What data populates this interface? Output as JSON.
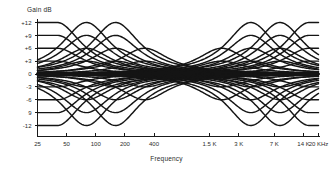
{
  "chart_data": {
    "type": "line",
    "title": "Gain dB",
    "xlabel": "Frequency",
    "ylabel": "Gain dB",
    "grid": false,
    "legend": "none",
    "ylim": [
      -12,
      12
    ],
    "y_ticks": [
      "+12",
      "+9",
      "+6",
      "+3",
      "0",
      "-3",
      "-6",
      "9",
      "-12"
    ],
    "y_tick_values": [
      12,
      9,
      6,
      3,
      0,
      -3,
      -6,
      -9,
      -12
    ],
    "x_ticks": [
      "25",
      "50",
      "100",
      "200",
      "400",
      "1.5 K",
      "3 K",
      "7 K",
      "14 K",
      "20 KHz"
    ],
    "x_tick_values": [
      25,
      50,
      100,
      200,
      400,
      1500,
      3000,
      7000,
      14000,
      20000
    ],
    "xlim": [
      25,
      20000
    ],
    "x_scale": "log",
    "band_centers": [
      40,
      80,
      160,
      320,
      2000,
      4000,
      8000,
      16000
    ],
    "settings_db": [
      12,
      9,
      6,
      3,
      -3,
      -6,
      -9,
      -12
    ],
    "series": [
      {
        "name": "Band 40 Hz +12 dB",
        "center": 40,
        "gain": 12,
        "shelf": "low"
      },
      {
        "name": "Band 40 Hz +9 dB",
        "center": 40,
        "gain": 9,
        "shelf": "low"
      },
      {
        "name": "Band 40 Hz +6 dB",
        "center": 40,
        "gain": 6,
        "shelf": "low"
      },
      {
        "name": "Band 40 Hz +3 dB",
        "center": 40,
        "gain": 3,
        "shelf": "low"
      },
      {
        "name": "Band 40 Hz -3 dB",
        "center": 40,
        "gain": -3,
        "shelf": "low"
      },
      {
        "name": "Band 40 Hz -6 dB",
        "center": 40,
        "gain": -6,
        "shelf": "low"
      },
      {
        "name": "Band 40 Hz -9 dB",
        "center": 40,
        "gain": -9,
        "shelf": "low"
      },
      {
        "name": "Band 40 Hz -12 dB",
        "center": 40,
        "gain": -12,
        "shelf": "low"
      },
      {
        "name": "Band 80 Hz +12 dB",
        "center": 80,
        "gain": 12,
        "shelf": "none"
      },
      {
        "name": "Band 80 Hz +9 dB",
        "center": 80,
        "gain": 9,
        "shelf": "none"
      },
      {
        "name": "Band 80 Hz +6 dB",
        "center": 80,
        "gain": 6,
        "shelf": "none"
      },
      {
        "name": "Band 80 Hz +3 dB",
        "center": 80,
        "gain": 3,
        "shelf": "none"
      },
      {
        "name": "Band 80 Hz -3 dB",
        "center": 80,
        "gain": -3,
        "shelf": "none"
      },
      {
        "name": "Band 80 Hz -6 dB",
        "center": 80,
        "gain": -6,
        "shelf": "none"
      },
      {
        "name": "Band 80 Hz -9 dB",
        "center": 80,
        "gain": -9,
        "shelf": "none"
      },
      {
        "name": "Band 80 Hz -12 dB",
        "center": 80,
        "gain": -12,
        "shelf": "none"
      },
      {
        "name": "Band 160 Hz +12 dB",
        "center": 160,
        "gain": 12,
        "shelf": "none"
      },
      {
        "name": "Band 160 Hz +9 dB",
        "center": 160,
        "gain": 9,
        "shelf": "none"
      },
      {
        "name": "Band 160 Hz +6 dB",
        "center": 160,
        "gain": 6,
        "shelf": "none"
      },
      {
        "name": "Band 160 Hz +3 dB",
        "center": 160,
        "gain": 3,
        "shelf": "none"
      },
      {
        "name": "Band 160 Hz -3 dB",
        "center": 160,
        "gain": -3,
        "shelf": "none"
      },
      {
        "name": "Band 160 Hz -6 dB",
        "center": 160,
        "gain": -6,
        "shelf": "none"
      },
      {
        "name": "Band 160 Hz -9 dB",
        "center": 160,
        "gain": -9,
        "shelf": "none"
      },
      {
        "name": "Band 160 Hz -12 dB",
        "center": 160,
        "gain": -12,
        "shelf": "none"
      },
      {
        "name": "Band 320 Hz +6 dB",
        "center": 320,
        "gain": 6,
        "shelf": "none"
      },
      {
        "name": "Band 320 Hz +3 dB",
        "center": 320,
        "gain": 3,
        "shelf": "none"
      },
      {
        "name": "Band 320 Hz -3 dB",
        "center": 320,
        "gain": -3,
        "shelf": "none"
      },
      {
        "name": "Band 320 Hz -6 dB",
        "center": 320,
        "gain": -6,
        "shelf": "none"
      },
      {
        "name": "Band 2 KHz +6 dB",
        "center": 2000,
        "gain": 6,
        "shelf": "none"
      },
      {
        "name": "Band 2 KHz +3 dB",
        "center": 2000,
        "gain": 3,
        "shelf": "none"
      },
      {
        "name": "Band 2 KHz -3 dB",
        "center": 2000,
        "gain": -3,
        "shelf": "none"
      },
      {
        "name": "Band 2 KHz -6 dB",
        "center": 2000,
        "gain": -6,
        "shelf": "none"
      },
      {
        "name": "Band 4 KHz +12 dB",
        "center": 4000,
        "gain": 12,
        "shelf": "none"
      },
      {
        "name": "Band 4 KHz +9 dB",
        "center": 4000,
        "gain": 9,
        "shelf": "none"
      },
      {
        "name": "Band 4 KHz +6 dB",
        "center": 4000,
        "gain": 6,
        "shelf": "none"
      },
      {
        "name": "Band 4 KHz +3 dB",
        "center": 4000,
        "gain": 3,
        "shelf": "none"
      },
      {
        "name": "Band 4 KHz -3 dB",
        "center": 4000,
        "gain": -3,
        "shelf": "none"
      },
      {
        "name": "Band 4 KHz -6 dB",
        "center": 4000,
        "gain": -6,
        "shelf": "none"
      },
      {
        "name": "Band 4 KHz -9 dB",
        "center": 4000,
        "gain": -9,
        "shelf": "none"
      },
      {
        "name": "Band 4 KHz -12 dB",
        "center": 4000,
        "gain": -12,
        "shelf": "none"
      },
      {
        "name": "Band 8 KHz +12 dB",
        "center": 8000,
        "gain": 12,
        "shelf": "none"
      },
      {
        "name": "Band 8 KHz +9 dB",
        "center": 8000,
        "gain": 9,
        "shelf": "none"
      },
      {
        "name": "Band 8 KHz +6 dB",
        "center": 8000,
        "gain": 6,
        "shelf": "none"
      },
      {
        "name": "Band 8 KHz +3 dB",
        "center": 8000,
        "gain": 3,
        "shelf": "none"
      },
      {
        "name": "Band 8 KHz -3 dB",
        "center": 8000,
        "gain": -3,
        "shelf": "none"
      },
      {
        "name": "Band 8 KHz -6 dB",
        "center": 8000,
        "gain": -6,
        "shelf": "none"
      },
      {
        "name": "Band 8 KHz -9 dB",
        "center": 8000,
        "gain": -9,
        "shelf": "none"
      },
      {
        "name": "Band 8 KHz -12 dB",
        "center": 8000,
        "gain": -12,
        "shelf": "none"
      },
      {
        "name": "Band 16 KHz +12 dB",
        "center": 16000,
        "gain": 12,
        "shelf": "high"
      },
      {
        "name": "Band 16 KHz +9 dB",
        "center": 16000,
        "gain": 9,
        "shelf": "high"
      },
      {
        "name": "Band 16 KHz +6 dB",
        "center": 16000,
        "gain": 6,
        "shelf": "high"
      },
      {
        "name": "Band 16 KHz +3 dB",
        "center": 16000,
        "gain": 3,
        "shelf": "high"
      },
      {
        "name": "Band 16 KHz -3 dB",
        "center": 16000,
        "gain": -3,
        "shelf": "high"
      },
      {
        "name": "Band 16 KHz -6 dB",
        "center": 16000,
        "gain": -6,
        "shelf": "high"
      },
      {
        "name": "Band 16 KHz -9 dB",
        "center": 16000,
        "gain": -9,
        "shelf": "high"
      },
      {
        "name": "Band 16 KHz -12 dB",
        "center": 16000,
        "gain": -12,
        "shelf": "high"
      }
    ],
    "curve_color": "#141414",
    "axis_color": "#1a1a1a",
    "background_color": "#ffffff"
  }
}
